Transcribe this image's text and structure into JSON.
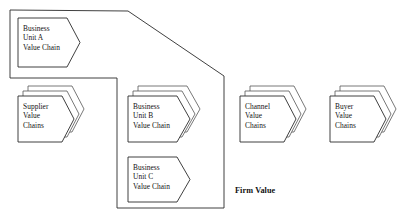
{
  "diagram": {
    "boundary_label": "Firm Value",
    "stroke_color": "#2a2a2a",
    "fill_color": "#ffffff",
    "background_color": "#ffffff",
    "boundary": {
      "name": "firm-value-boundary",
      "points": "10,10 128,11 224,76 224,208 117,208 117,78 10,78"
    },
    "nodes": [
      {
        "id": "business-unit-a",
        "lines": [
          "Business",
          "Unit A",
          "Value Chain"
        ],
        "stacked": false,
        "stack_count": 1,
        "x": 18,
        "y": 18,
        "w": 62,
        "h": 49,
        "notch": 13,
        "text_x": 23,
        "text_y": 24
      },
      {
        "id": "supplier-value-chains",
        "lines": [
          "Supplier",
          "Value",
          "Chains"
        ],
        "stacked": true,
        "stack_count": 3,
        "x": 18,
        "y": 96,
        "w": 56,
        "h": 46,
        "notch": 12,
        "text_x": 23,
        "text_y": 102
      },
      {
        "id": "business-unit-b",
        "lines": [
          "Business",
          "Unit B",
          "Value Chain"
        ],
        "stacked": true,
        "stack_count": 3,
        "x": 128,
        "y": 96,
        "w": 62,
        "h": 46,
        "notch": 13,
        "text_x": 133,
        "text_y": 102
      },
      {
        "id": "business-unit-c",
        "lines": [
          "Business",
          "Unit C",
          "Value Chain"
        ],
        "stacked": false,
        "stack_count": 1,
        "x": 128,
        "y": 157,
        "w": 62,
        "h": 45,
        "notch": 13,
        "text_x": 133,
        "text_y": 163
      },
      {
        "id": "channel-value-chains",
        "lines": [
          "Channel",
          "Value",
          "Chains"
        ],
        "stacked": true,
        "stack_count": 3,
        "x": 240,
        "y": 96,
        "w": 56,
        "h": 46,
        "notch": 12,
        "text_x": 245,
        "text_y": 102
      },
      {
        "id": "buyer-value-chains",
        "lines": [
          "Buyer",
          "Value",
          "Chains"
        ],
        "stacked": true,
        "stack_count": 3,
        "x": 330,
        "y": 96,
        "w": 56,
        "h": 46,
        "notch": 12,
        "text_x": 335,
        "text_y": 102
      }
    ],
    "firm_label_pos": {
      "x": 235,
      "y": 186
    }
  }
}
